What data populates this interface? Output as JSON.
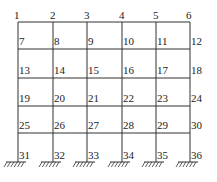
{
  "diagram": {
    "type": "frame-grid",
    "columns_x": [
      18,
      53,
      87,
      122,
      156,
      190
    ],
    "rows_y": [
      22,
      49,
      78,
      106,
      133,
      160
    ],
    "line_color": "#333333",
    "nodes": [
      [
        "1",
        "2",
        "3",
        "4",
        "5",
        "6"
      ],
      [
        "7",
        "8",
        "9",
        "10",
        "11",
        "12"
      ],
      [
        "13",
        "14",
        "15",
        "16",
        "17",
        "18"
      ],
      [
        "19",
        "20",
        "21",
        "22",
        "23",
        "24"
      ],
      [
        "25",
        "26",
        "27",
        "28",
        "29",
        "30"
      ],
      [
        "31",
        "32",
        "33",
        "34",
        "35",
        "36"
      ]
    ],
    "supports": "fixed"
  }
}
